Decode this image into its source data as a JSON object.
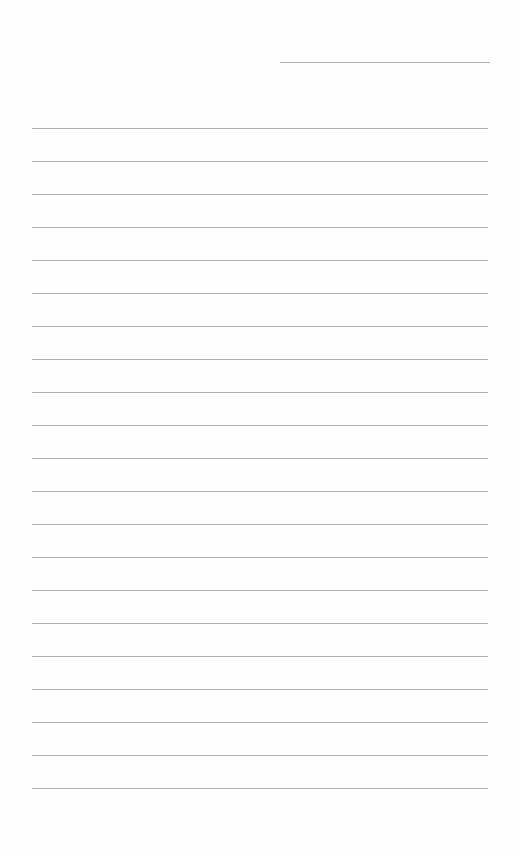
{
  "page": {
    "type": "blank ruled sheet",
    "text": "",
    "colors": {
      "paper": "#fefefe",
      "rule": "#9c9c9c"
    }
  },
  "header_line": {
    "x": 280,
    "y": 62,
    "width": 210
  },
  "ruled_lines": {
    "count": 21,
    "x": 32,
    "width": 456,
    "first_y": 128,
    "spacing": 33
  }
}
